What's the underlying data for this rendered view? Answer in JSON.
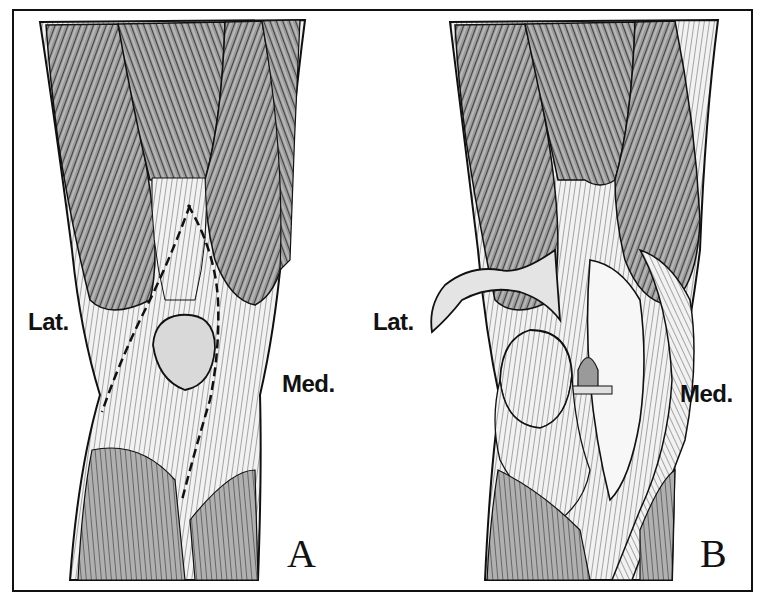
{
  "figure": {
    "panels": [
      {
        "id": "A",
        "letter": "A",
        "lateral_label": "Lat.",
        "medial_label": "Med.",
        "description": "Anterior knee with quadriceps muscles, patella and dashed incision lines (lateral and medial parapatellar)"
      },
      {
        "id": "B",
        "letter": "B",
        "lateral_label": "Lat.",
        "medial_label": "Med.",
        "description": "Knee arthrotomy with quadriceps tendon flap reflected laterally and patella everted, exposing the joint"
      }
    ],
    "colors": {
      "ink": "#111111",
      "muscle_fill": "#8a8a8a",
      "tendon_fill": "#d8d8d8",
      "background": "#ffffff"
    }
  }
}
